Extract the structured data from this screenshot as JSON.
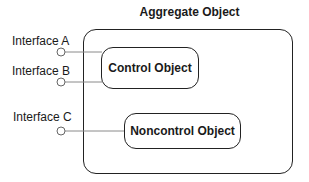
{
  "diagram": {
    "title": "Aggregate Object",
    "objects": [
      {
        "id": "control",
        "label": "Control Object"
      },
      {
        "id": "noncontrol",
        "label": "Noncontrol Object"
      }
    ],
    "interfaces": [
      {
        "id": "A",
        "label": "Interface A",
        "connects_to": "control"
      },
      {
        "id": "B",
        "label": "Interface B",
        "connects_to": "control"
      },
      {
        "id": "C",
        "label": "Interface C",
        "connects_to": "noncontrol"
      }
    ],
    "colors": {
      "stroke": "#222222",
      "connector": "#8a8a8a",
      "background": "#ffffff"
    }
  }
}
